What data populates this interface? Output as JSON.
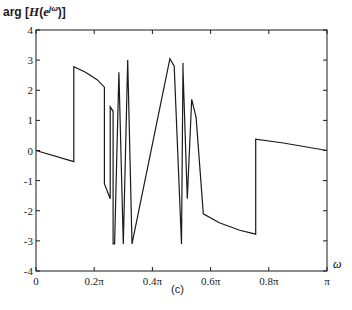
{
  "chart_data": {
    "type": "line",
    "title": "",
    "caption": "(c)",
    "ylabel": "arg [H(e^{jω})]",
    "xlabel": "ω",
    "xlim": [
      0,
      1
    ],
    "xlim_units": "π",
    "ylim": [
      -4,
      4
    ],
    "grid": false,
    "legend": null,
    "xticks": [
      0,
      0.2,
      0.4,
      0.6,
      0.8,
      1.0
    ],
    "xtick_labels": [
      "0",
      "0.2π",
      "0.4π",
      "0.6π",
      "0.8π",
      "π"
    ],
    "yticks": [
      4,
      3,
      2,
      1,
      0,
      -1,
      -2,
      -3,
      -4
    ],
    "ytick_labels": [
      "4",
      "3",
      "2",
      "1",
      "0",
      "-1",
      "-2",
      "-3",
      "-4"
    ],
    "series": [
      {
        "name": "phase",
        "x": [
          0.0,
          0.13,
          0.13,
          0.17,
          0.21,
          0.235,
          0.235,
          0.255,
          0.255,
          0.265,
          0.265,
          0.27,
          0.285,
          0.285,
          0.3,
          0.3,
          0.315,
          0.315,
          0.33,
          0.33,
          0.46,
          0.46,
          0.475,
          0.475,
          0.5,
          0.5,
          0.505,
          0.505,
          0.52,
          0.52,
          0.535,
          0.535,
          0.55,
          0.55,
          0.575,
          0.575,
          0.63,
          0.7,
          0.755,
          0.755,
          0.85,
          1.0
        ],
        "y": [
          0.0,
          -0.37,
          2.78,
          2.6,
          2.35,
          2.1,
          -1.1,
          -1.6,
          1.45,
          1.3,
          -3.1,
          -3.1,
          2.6,
          2.6,
          -3.1,
          -3.1,
          3.0,
          3.0,
          -3.1,
          -3.1,
          3.05,
          3.05,
          2.8,
          2.8,
          -3.1,
          -3.1,
          2.9,
          2.7,
          -1.6,
          -1.6,
          1.7,
          1.7,
          1.1,
          1.1,
          -2.1,
          -2.1,
          -2.4,
          -2.65,
          -2.78,
          0.38,
          0.25,
          0.0
        ]
      }
    ]
  },
  "labels": {
    "ylabel_prefix": "arg [",
    "ylabel_H": "H",
    "ylabel_paren_open": "(",
    "ylabel_e": "e",
    "ylabel_sup": "jω",
    "ylabel_suffix": ")]",
    "caption": "(c)",
    "xlabel": "ω"
  }
}
